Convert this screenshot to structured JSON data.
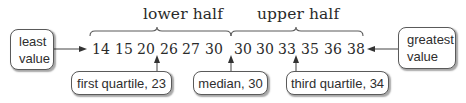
{
  "diagram": {
    "title_labels": {
      "lower_half": "lower half",
      "upper_half": "upper half"
    },
    "data_values": [
      "14",
      "15",
      "20",
      "26",
      "27",
      "30",
      "30",
      "30",
      "33",
      "35",
      "36",
      "38"
    ],
    "callouts": {
      "least_value": {
        "line1": "least",
        "line2": "value"
      },
      "greatest_value": {
        "line1": "greatest",
        "line2": "value"
      },
      "first_quartile": "first quartile, 23",
      "median": "median, 30",
      "third_quartile": "third quartile, 34"
    },
    "colors": {
      "text": "#2a2a2a",
      "lines": "#555555",
      "box_border": "#5a5a5a",
      "background": "#ffffff"
    }
  }
}
